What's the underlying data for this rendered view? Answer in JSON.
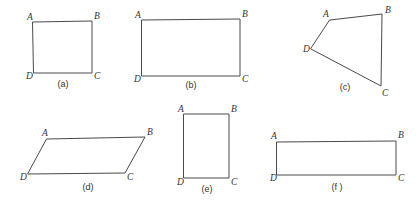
{
  "sheet": {
    "title": "Quadrilaterals figure sheet",
    "width": 416,
    "height": 204,
    "background_color": "#ffffff",
    "stroke_color": "#4a4a4a",
    "label_color": "#333333"
  },
  "figures": [
    {
      "id": "a",
      "caption": "(a)",
      "shape_kind": "square",
      "caption_pos": {
        "x": 63,
        "y": 87
      },
      "points": "33,22 92,21 92,73 34,73",
      "vertices": [
        {
          "name": "A",
          "label": "A",
          "x": 27,
          "y": 20
        },
        {
          "name": "B",
          "label": "B",
          "x": 94,
          "y": 19
        },
        {
          "name": "C",
          "label": "C",
          "x": 94,
          "y": 79
        },
        {
          "name": "D",
          "label": "D",
          "x": 26,
          "y": 79
        }
      ]
    },
    {
      "id": "b",
      "caption": "(b)",
      "shape_kind": "rectangle-wide",
      "caption_pos": {
        "x": 191,
        "y": 88
      },
      "points": "142,20 240,19 240,76 142,76",
      "vertices": [
        {
          "name": "A",
          "label": "A",
          "x": 135,
          "y": 18
        },
        {
          "name": "B",
          "label": "B",
          "x": 242,
          "y": 17
        },
        {
          "name": "C",
          "label": "C",
          "x": 242,
          "y": 82
        },
        {
          "name": "D",
          "label": "D",
          "x": 134,
          "y": 82
        }
      ]
    },
    {
      "id": "c",
      "caption": "(c)",
      "shape_kind": "irregular-quadrilateral",
      "caption_pos": {
        "x": 345,
        "y": 90
      },
      "points": "330,20 382,14 381,86 311,49",
      "vertices": [
        {
          "name": "A",
          "label": "A",
          "x": 323,
          "y": 17
        },
        {
          "name": "B",
          "label": "B",
          "x": 385,
          "y": 13
        },
        {
          "name": "C",
          "label": "C",
          "x": 382,
          "y": 96
        },
        {
          "name": "D",
          "label": "D",
          "x": 303,
          "y": 52
        }
      ]
    },
    {
      "id": "d",
      "caption": "(d)",
      "shape_kind": "parallelogram",
      "caption_pos": {
        "x": 88,
        "y": 190
      },
      "points": "47,139 145,137 125,173 28,174",
      "vertices": [
        {
          "name": "A",
          "label": "A",
          "x": 42,
          "y": 136
        },
        {
          "name": "B",
          "label": "B",
          "x": 147,
          "y": 135
        },
        {
          "name": "C",
          "label": "C",
          "x": 127,
          "y": 180
        },
        {
          "name": "D",
          "label": "D",
          "x": 20,
          "y": 180
        }
      ]
    },
    {
      "id": "e",
      "caption": "(e)",
      "shape_kind": "rectangle-tall",
      "caption_pos": {
        "x": 207,
        "y": 192
      },
      "points": "184,114 229,114 229,178 184,178",
      "vertices": [
        {
          "name": "A",
          "label": "A",
          "x": 178,
          "y": 112
        },
        {
          "name": "B",
          "label": "B",
          "x": 231,
          "y": 112
        },
        {
          "name": "C",
          "label": "C",
          "x": 231,
          "y": 185
        },
        {
          "name": "D",
          "label": "D",
          "x": 177,
          "y": 185
        }
      ]
    },
    {
      "id": "f",
      "caption": "(f )",
      "shape_kind": "rectangle-wide",
      "caption_pos": {
        "x": 337,
        "y": 190
      },
      "points": "277,142 396,141 396,175 277,175",
      "vertices": [
        {
          "name": "A",
          "label": "A",
          "x": 271,
          "y": 139
        },
        {
          "name": "B",
          "label": "B",
          "x": 398,
          "y": 138
        },
        {
          "name": "C",
          "label": "C",
          "x": 398,
          "y": 181
        },
        {
          "name": "D",
          "label": "D",
          "x": 270,
          "y": 181
        }
      ]
    }
  ]
}
